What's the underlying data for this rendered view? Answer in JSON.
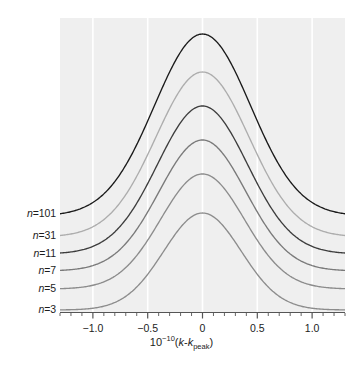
{
  "chart_data": {
    "type": "line",
    "title": "",
    "subtitle": "",
    "xlabel": "10^-10(k-k_peak)",
    "xlabel_parts": {
      "base": "10",
      "exponent": "−10",
      "open_paren": "(",
      "k1": "k",
      "minus": "-",
      "k2": "k",
      "sub": "peak",
      "close_paren": ")"
    },
    "ylabel": "",
    "xlim": [
      -1.3,
      1.3
    ],
    "ylim": [
      0,
      1
    ],
    "grid": true,
    "grid_orientation": "vertical",
    "grid_color": "#ffffff",
    "panel_background": "#efefef",
    "legend_position": "left-inline",
    "x_major_ticks": [
      -1.0,
      -0.5,
      0,
      0.5,
      1.0
    ],
    "x_major_tick_labels": [
      "−1.0",
      "−0.5",
      "0",
      "0.5",
      "1.0"
    ],
    "x_minor_tick_step": 0.1,
    "series": [
      {
        "name": "n=101",
        "label_prefix": "n",
        "label_suffix": "=101",
        "color": "#1a1a1a",
        "baseline": 0.3265,
        "amplitude": 0.619,
        "width": 0.62,
        "shape_exponent": 2.0,
        "linewidth": 1.35
      },
      {
        "name": "n=31",
        "label_prefix": "n",
        "label_suffix": "=31",
        "color": "#adadad",
        "baseline": 0.2551,
        "amplitude": 0.5612,
        "width": 0.6,
        "shape_exponent": 2.0,
        "linewidth": 1.35
      },
      {
        "name": "n=11",
        "label_prefix": "n",
        "label_suffix": "=11",
        "color": "#3d3d3d",
        "baseline": 0.1973,
        "amplitude": 0.5034,
        "width": 0.58,
        "shape_exponent": 2.0,
        "linewidth": 1.35
      },
      {
        "name": "n=7",
        "label_prefix": "n",
        "label_suffix": "=7",
        "color": "#7a7a7a",
        "baseline": 0.1395,
        "amplitude": 0.4456,
        "width": 0.56,
        "shape_exponent": 2.0,
        "linewidth": 1.35
      },
      {
        "name": "n=5",
        "label_prefix": "n",
        "label_suffix": "=5",
        "color": "#8c8c8c",
        "baseline": 0.0782,
        "amplitude": 0.3912,
        "width": 0.54,
        "shape_exponent": 2.0,
        "linewidth": 1.35
      },
      {
        "name": "n=3",
        "label_prefix": "n",
        "label_suffix": "=3",
        "color": "#8c8c8c",
        "baseline": 0.0068,
        "amplitude": 0.3299,
        "width": 0.5,
        "shape_exponent": 2.0,
        "linewidth": 1.35
      }
    ]
  },
  "figure": {
    "plot_left": 60,
    "plot_top": 18,
    "plot_width": 285,
    "plot_height": 294,
    "axis_color": "#555555"
  }
}
